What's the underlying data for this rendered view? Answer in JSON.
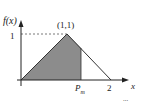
{
  "diagram": {
    "type": "triangular-pdf",
    "y_axis_label": "f(x)",
    "x_axis_label": "x",
    "y_tick_label": "1",
    "peak_label": "(1,1)",
    "x_tick_labels": {
      "pm": "P",
      "pm_sub": "m",
      "two": "2"
    },
    "corner_fragment": "...",
    "colors": {
      "shade": "#8c8c8c",
      "line": "#333333",
      "dash": "#555555"
    }
  }
}
